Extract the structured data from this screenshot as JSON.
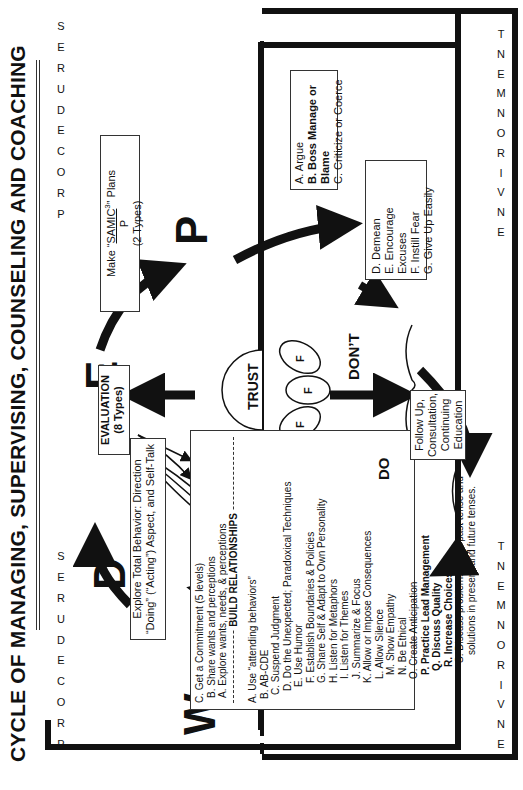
{
  "title": "CYCLE OF MANAGING, SUPERVISING, COUNSELING AND COACHING",
  "labels": {
    "procedures": [
      "P",
      "R",
      "O",
      "C",
      "E",
      "D",
      "U",
      "R",
      "E",
      "S"
    ],
    "environment": [
      "E",
      "N",
      "V",
      "I",
      "R",
      "O",
      "N",
      "M",
      "E",
      "N",
      "T"
    ]
  },
  "big_letters": {
    "w": "W",
    "d": "D",
    "e": "E",
    "p": "P"
  },
  "evaluation_box": {
    "line1": "EVALUATION",
    "line2": "(8 Types)"
  },
  "plans_box": {
    "prefix": "Make “",
    "samic": "SAMIC",
    "sup": "3",
    "suffix": "” Plans",
    "denominator": "P",
    "types": "(2 Types)"
  },
  "explore_box": {
    "line1": "Explore Total Behavior: Direction",
    "line2": "“Doing” (“Acting”) Aspect, and Self-Talk"
  },
  "w_box": {
    "top_items": [
      "C. Get a Commitment (5 levels)",
      "B. Share wants and perceptions",
      "A. Explore wants, needs, & perceptions"
    ],
    "section_header": "BUILD RELATIONSHIPS",
    "items": [
      {
        "text": "A. Use “attending behaviors”",
        "bold": false,
        "indent": 0
      },
      {
        "text": "B. AB-CDE",
        "bold": false,
        "indent": 1
      },
      {
        "text": "C. Suspend Judgment",
        "bold": false,
        "indent": 2
      },
      {
        "text": "D. Do the Unexpected; Paradoxical Techniques",
        "bold": false,
        "indent": 3
      },
      {
        "text": "E. Use Humor",
        "bold": false,
        "indent": 4
      },
      {
        "text": "F. Establish Boundaries & Policies",
        "bold": false,
        "indent": 5
      },
      {
        "text": "G. Share Self & Adapt to Own Personality",
        "bold": false,
        "indent": 5
      },
      {
        "text": "H. Listen for Metaphors",
        "bold": false,
        "indent": 5
      },
      {
        "text": "I. Listen for Themes",
        "bold": false,
        "indent": 6
      },
      {
        "text": "J. Summarize & Focus",
        "bold": false,
        "indent": 6
      },
      {
        "text": "K. Allow or Impose Consequences",
        "bold": false,
        "indent": 5
      },
      {
        "text": "L. Allow Silence",
        "bold": false,
        "indent": 6
      },
      {
        "text": "M. Show Empathy",
        "bold": false,
        "indent": 7
      },
      {
        "text": "N. Be Ethical",
        "bold": false,
        "indent": 7
      },
      {
        "text": "O. Create Anticipation",
        "bold": false,
        "indent": 6
      },
      {
        "text": "P. Practice Lead Management",
        "bold": true,
        "indent": 7
      },
      {
        "text": "Q. Discuss Quality",
        "bold": true,
        "indent": 8
      },
      {
        "text": "R. Increase Choices",
        "bold": true,
        "indent": 9
      },
      {
        "text": "S. Discuss problems in the past tense and",
        "bold": false,
        "indent": 10
      },
      {
        "text": "solutions in present and future tenses.",
        "bold": false,
        "indent": 12
      }
    ]
  },
  "dont_box_1": [
    "A. Argue",
    "B. Boss Manage or Blame",
    "C. Criticize or Coerce"
  ],
  "dont_box_1_bold": [
    false,
    true,
    false
  ],
  "dont_box_2": [
    "D. Demean",
    "E. Encourage Excuses",
    "F. Instill Fear",
    "G. Give Up Easily"
  ],
  "follow_box": [
    "Follow Up,",
    "Consultation,",
    "Continuing",
    "Education"
  ],
  "trust": {
    "label": "TRUST",
    "petals": [
      "F",
      "F",
      "F"
    ]
  },
  "dont_label": "DON’T",
  "do_label": "DO"
}
